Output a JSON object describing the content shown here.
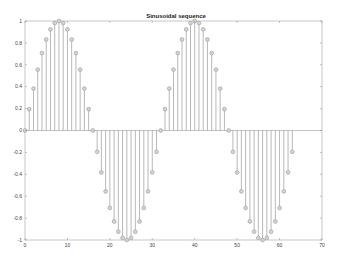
{
  "chart_data": {
    "type": "stem",
    "title": "Sinusoidal sequence",
    "xlabel": "",
    "ylabel": "",
    "xlim": [
      0,
      70
    ],
    "ylim": [
      -1,
      1
    ],
    "grid": false,
    "legend": null,
    "x_ticks": [
      0,
      10,
      20,
      30,
      40,
      50,
      60,
      70
    ],
    "y_ticks": [
      -1,
      -0.8,
      -0.6,
      -0.4,
      -0.2,
      0,
      0.2,
      0.4,
      0.6,
      0.8,
      1
    ],
    "y_tick_labels": [
      "-1",
      "-0.8",
      "-0.6",
      "-0.4",
      "-0.2",
      "0",
      "0.2",
      "0.4",
      "0.6",
      "0.8",
      "1"
    ],
    "series": [
      {
        "name": "sin(2*pi*n/32)",
        "color": "#9a9a9a",
        "marker": "circle",
        "x": [
          0,
          1,
          2,
          3,
          4,
          5,
          6,
          7,
          8,
          9,
          10,
          11,
          12,
          13,
          14,
          15,
          16,
          17,
          18,
          19,
          20,
          21,
          22,
          23,
          24,
          25,
          26,
          27,
          28,
          29,
          30,
          31,
          32,
          33,
          34,
          35,
          36,
          37,
          38,
          39,
          40,
          41,
          42,
          43,
          44,
          45,
          46,
          47,
          48,
          49,
          50,
          51,
          52,
          53,
          54,
          55,
          56,
          57,
          58,
          59,
          60,
          61,
          62,
          63
        ],
        "values": [
          0,
          0.195,
          0.383,
          0.556,
          0.707,
          0.831,
          0.924,
          0.981,
          1,
          0.981,
          0.924,
          0.831,
          0.707,
          0.556,
          0.383,
          0.195,
          0,
          -0.195,
          -0.383,
          -0.556,
          -0.707,
          -0.831,
          -0.924,
          -0.981,
          -1,
          -0.981,
          -0.924,
          -0.831,
          -0.707,
          -0.556,
          -0.383,
          -0.195,
          0,
          0.195,
          0.383,
          0.556,
          0.707,
          0.831,
          0.924,
          0.981,
          1,
          0.981,
          0.924,
          0.831,
          0.707,
          0.556,
          0.383,
          0.195,
          0,
          -0.195,
          -0.383,
          -0.556,
          -0.707,
          -0.831,
          -0.924,
          -0.981,
          -1,
          -0.981,
          -0.924,
          -0.831,
          -0.707,
          -0.556,
          -0.383,
          -0.195
        ]
      }
    ]
  },
  "layout": {
    "plot_left": 25,
    "plot_right": 322,
    "plot_top": 21,
    "plot_bottom": 240
  }
}
